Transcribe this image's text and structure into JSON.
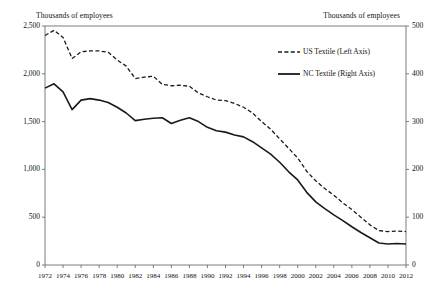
{
  "chart_data": {
    "type": "line",
    "title": "",
    "subtitle": "",
    "xlabel": "",
    "left_axis_title": "Thousands of employees",
    "right_axis_title": "Thousands of employees",
    "grid": false,
    "legend_position": "top-right",
    "x": [
      1972,
      1973,
      1974,
      1975,
      1976,
      1977,
      1978,
      1979,
      1980,
      1981,
      1982,
      1983,
      1984,
      1985,
      1986,
      1987,
      1988,
      1989,
      1990,
      1991,
      1992,
      1993,
      1994,
      1995,
      1996,
      1997,
      1998,
      1999,
      2000,
      2001,
      2002,
      2003,
      2004,
      2005,
      2006,
      2007,
      2008,
      2009,
      2010,
      2011,
      2012
    ],
    "xlim": [
      1972,
      2012
    ],
    "xticks": [
      1972,
      1974,
      1976,
      1978,
      1980,
      1982,
      1984,
      1986,
      1988,
      1990,
      1992,
      1994,
      1996,
      1998,
      2000,
      2002,
      2004,
      2006,
      2008,
      2010,
      2012
    ],
    "xticklabels": [
      "1972",
      "1974",
      "1976",
      "1978",
      "1980",
      "1982",
      "1984",
      "1986",
      "1988",
      "1990",
      "1992",
      "1994",
      "1996",
      "1998",
      "2000",
      "2002",
      "2004",
      "2006",
      "2008",
      "2010",
      "2012"
    ],
    "left_ylim": [
      0,
      2500
    ],
    "left_yticks": [
      0,
      500,
      1000,
      1500,
      2000,
      2500
    ],
    "left_yticklabels": [
      "0",
      "500",
      "1,000",
      "1,500",
      "2,000",
      "2,500"
    ],
    "right_ylim": [
      0,
      500
    ],
    "right_yticks": [
      0,
      100,
      200,
      300,
      400,
      500
    ],
    "right_yticklabels": [
      "0",
      "100",
      "200",
      "300",
      "400",
      "500"
    ],
    "series": [
      {
        "name": "US Textile (Left Axis)",
        "axis": "left",
        "style": "dashed",
        "color": "#1a1a1a",
        "legend_label": "US Textile (Left Axis)",
        "values": [
          2400,
          2455,
          2380,
          2160,
          2230,
          2240,
          2240,
          2225,
          2145,
          2080,
          1950,
          1965,
          1975,
          1890,
          1875,
          1880,
          1870,
          1800,
          1760,
          1725,
          1720,
          1690,
          1650,
          1590,
          1500,
          1420,
          1320,
          1220,
          1120,
          980,
          880,
          800,
          730,
          650,
          580,
          500,
          420,
          360,
          350,
          355,
          350
        ]
      },
      {
        "name": "NC Textile (Right Axis)",
        "axis": "right",
        "style": "solid",
        "color": "#1a1a1a",
        "legend_label": "NC Textile (Right Axis)",
        "values": [
          370,
          379,
          362,
          325,
          345,
          348,
          345,
          340,
          330,
          318,
          302,
          305,
          307,
          308,
          296,
          303,
          308,
          300,
          288,
          281,
          278,
          272,
          268,
          258,
          245,
          232,
          215,
          195,
          178,
          152,
          132,
          118,
          105,
          93,
          80,
          68,
          57,
          46,
          44,
          45,
          44
        ]
      }
    ]
  },
  "legend": {
    "items": [
      {
        "label": "US Textile (Left Axis)",
        "style": "dashed"
      },
      {
        "label": "NC Textile (Right Axis)",
        "style": "solid"
      }
    ]
  },
  "axes": {
    "left_title": "Thousands of employees",
    "right_title": "Thousands of employees"
  }
}
